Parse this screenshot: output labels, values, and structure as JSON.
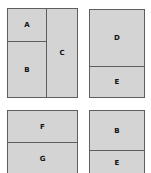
{
  "diagram": {
    "type": "layout-partition",
    "colors": {
      "fill": "#d4d4d4",
      "stroke": "#5e5e5e",
      "label": "#111111",
      "background": "#ffffff"
    },
    "panels": [
      {
        "id": "panel-1",
        "regions": [
          {
            "label": "A"
          },
          {
            "label": "B"
          },
          {
            "label": "C"
          }
        ]
      },
      {
        "id": "panel-2",
        "regions": [
          {
            "label": "D"
          },
          {
            "label": "E"
          }
        ]
      },
      {
        "id": "panel-3",
        "regions": [
          {
            "label": "F"
          },
          {
            "label": "G"
          }
        ]
      },
      {
        "id": "panel-4",
        "regions": [
          {
            "label": "B"
          },
          {
            "label": "E"
          }
        ]
      }
    ]
  }
}
